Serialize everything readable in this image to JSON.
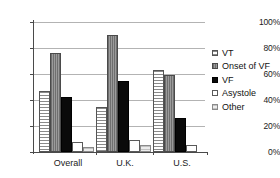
{
  "chart_data": {
    "type": "bar",
    "title": "",
    "subtitle": "",
    "xlabel": "",
    "ylabel": "",
    "ylim": [
      0,
      100
    ],
    "yticks": [
      "0%",
      "20%",
      "40%",
      "60%",
      "80%",
      "100%"
    ],
    "ytick_values": [
      0,
      20,
      40,
      60,
      80,
      100
    ],
    "grid": true,
    "legend_position": "right",
    "categories": [
      "Overall",
      "U.K.",
      "U.S."
    ],
    "series": [
      {
        "name": "VT",
        "color": "#e8e8e8",
        "values": [
          47,
          35,
          63
        ]
      },
      {
        "name": "Onset of VF",
        "color": "#8d8d8d",
        "values": [
          76,
          90,
          59
        ]
      },
      {
        "name": "VF",
        "color": "#0a0a0a",
        "values": [
          42,
          55,
          26
        ]
      },
      {
        "name": "Asystole",
        "color": "#ffffff",
        "values": [
          7.5,
          9.5,
          5.5
        ]
      },
      {
        "name": "Other",
        "color": "#dadada",
        "values": [
          3.5,
          5.5,
          0
        ]
      }
    ]
  },
  "legend": {
    "items": [
      {
        "label": "VT"
      },
      {
        "label": "Onset of VF"
      },
      {
        "label": "VF"
      },
      {
        "label": "Asystole"
      },
      {
        "label": "Other"
      }
    ]
  },
  "axes": {
    "y": {
      "ticks": [
        "100%",
        "80%",
        "60%",
        "40%",
        "20%",
        "0%"
      ]
    },
    "x": {
      "ticks": [
        "Overall",
        "U.K.",
        "U.S."
      ]
    }
  }
}
